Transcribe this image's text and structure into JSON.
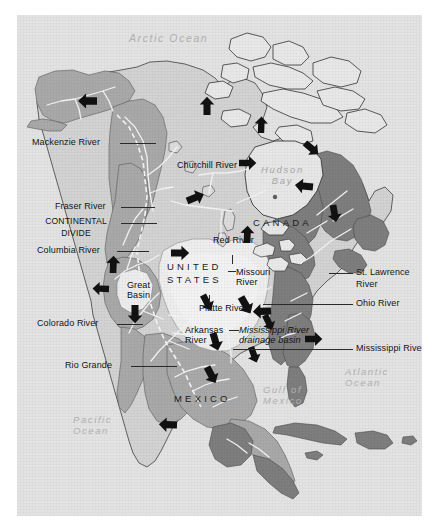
{
  "map": {
    "title": "North America — Mississippi River drainage basin",
    "frame": {
      "background": "#ffffff",
      "plate_color": "#e3e3e3"
    },
    "palette": {
      "ocean": "#e3e3e3",
      "land_light": "#d2d2d2",
      "basin_highlight": "#ededed",
      "land_mid": "#a9a9a9",
      "land_dark": "#7e7e7e",
      "river_line": "#f2f2f2",
      "coast_line": "#3a3a3a",
      "label_dark": "#151515",
      "label_ocean": "#b2b2b2",
      "arrow": "#111111"
    },
    "water_labels": [
      {
        "id": "arctic-ocean",
        "text": "Arctic Ocean",
        "style": "ocean"
      },
      {
        "id": "hudson-bay",
        "text": "Hudson\nBay",
        "style": "bay"
      },
      {
        "id": "gulf-of-mexico",
        "text": "Gulf of\nMexico",
        "style": "ocean"
      },
      {
        "id": "atlantic-ocean",
        "text": "Atlantic\nOcean",
        "style": "ocean"
      },
      {
        "id": "pacific-ocean",
        "text": "Pacific\nOcean",
        "style": "ocean"
      }
    ],
    "country_labels": [
      {
        "id": "canada",
        "text": "CANADA"
      },
      {
        "id": "united-states",
        "text": "UNITED\nSTATES"
      },
      {
        "id": "mexico",
        "text": "MEXICO"
      }
    ],
    "callout_labels": [
      {
        "id": "mackenzie-river",
        "text": "Mackenzie River",
        "side": "left"
      },
      {
        "id": "fraser-river",
        "text": "Fraser River",
        "side": "left"
      },
      {
        "id": "continental-divide",
        "text": "CONTINENTAL\nDIVIDE",
        "side": "left"
      },
      {
        "id": "columbia-river",
        "text": "Columbia River",
        "side": "left"
      },
      {
        "id": "colorado-river",
        "text": "Colorado River",
        "side": "left"
      },
      {
        "id": "rio-grande",
        "text": "Rio Grande",
        "side": "left"
      },
      {
        "id": "st-lawrence-river",
        "text": "St. Lawrence\nRiver",
        "side": "right"
      },
      {
        "id": "ohio-river",
        "text": "Ohio River",
        "side": "right"
      },
      {
        "id": "mississippi-river",
        "text": "Mississippi River",
        "side": "right"
      }
    ],
    "inset_labels": [
      {
        "id": "churchill-river",
        "text": "Churchill River"
      },
      {
        "id": "red-river",
        "text": "Red River"
      },
      {
        "id": "missouri-river",
        "text": "Missouri\nRiver"
      },
      {
        "id": "platte-river",
        "text": "Platte River"
      },
      {
        "id": "arkansas-river",
        "text": "Arkansas\nRiver"
      },
      {
        "id": "great-basin",
        "text": "Great\nBasin"
      },
      {
        "id": "drainage-basin",
        "text": "Mississippi River\ndrainage basin"
      }
    ],
    "flow_arrows_count": 17
  }
}
